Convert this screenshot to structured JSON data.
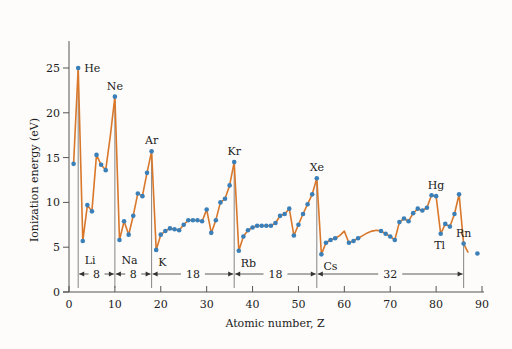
{
  "chart_data": {
    "type": "line",
    "title": "",
    "xlabel": "Atomic number, Z",
    "ylabel": "Ionization energy (eV)",
    "xlim": [
      0,
      90
    ],
    "ylim": [
      0,
      28
    ],
    "xticks": [
      0,
      10,
      20,
      30,
      40,
      50,
      60,
      70,
      80,
      90
    ],
    "yticks": [
      0,
      5,
      10,
      15,
      20,
      25
    ],
    "grid": false,
    "legend": null,
    "series": [
      {
        "name": "First ionization energy",
        "line_color": "#d9772a",
        "marker_color": "#3a7fb8",
        "points": [
          [
            1,
            14.3
          ],
          [
            2,
            25.0
          ],
          [
            3,
            5.7
          ],
          [
            4,
            9.7
          ],
          [
            5,
            9.0
          ],
          [
            6,
            15.3
          ],
          [
            7,
            14.2
          ],
          [
            8,
            13.6
          ],
          [
            9,
            17.4
          ],
          [
            10,
            21.8
          ],
          [
            11,
            5.8
          ],
          [
            12,
            7.9
          ],
          [
            13,
            6.4
          ],
          [
            14,
            8.5
          ],
          [
            15,
            11.0
          ],
          [
            16,
            10.7
          ],
          [
            17,
            13.3
          ],
          [
            18,
            15.7
          ],
          [
            19,
            4.7
          ],
          [
            20,
            6.4
          ],
          [
            21,
            6.8
          ],
          [
            22,
            7.1
          ],
          [
            23,
            7.0
          ],
          [
            24,
            6.9
          ],
          [
            25,
            7.5
          ],
          [
            26,
            8.0
          ],
          [
            27,
            8.0
          ],
          [
            28,
            8.0
          ],
          [
            29,
            7.9
          ],
          [
            30,
            9.2
          ],
          [
            31,
            6.6
          ],
          [
            32,
            8.0
          ],
          [
            33,
            10.0
          ],
          [
            34,
            10.4
          ],
          [
            35,
            11.9
          ],
          [
            36,
            14.5
          ],
          [
            37,
            4.6
          ],
          [
            38,
            6.2
          ],
          [
            39,
            6.9
          ],
          [
            40,
            7.2
          ],
          [
            41,
            7.4
          ],
          [
            42,
            7.4
          ],
          [
            43,
            7.4
          ],
          [
            44,
            7.4
          ],
          [
            45,
            7.7
          ],
          [
            46,
            8.5
          ],
          [
            47,
            8.7
          ],
          [
            48,
            9.3
          ],
          [
            49,
            6.3
          ],
          [
            50,
            7.5
          ],
          [
            51,
            8.7
          ],
          [
            52,
            9.8
          ],
          [
            53,
            10.9
          ],
          [
            54,
            12.7
          ],
          [
            55,
            4.2
          ],
          [
            56,
            5.5
          ],
          [
            57,
            5.8
          ],
          [
            58,
            6.0
          ],
          [
            59,
            6.3
          ],
          [
            60,
            6.8
          ],
          [
            61,
            5.5
          ],
          [
            62,
            5.7
          ],
          [
            63,
            6.0
          ],
          [
            64,
            6.3
          ],
          [
            65,
            6.6
          ],
          [
            66,
            6.8
          ],
          [
            67,
            6.9
          ],
          [
            68,
            6.8
          ],
          [
            69,
            6.5
          ],
          [
            70,
            6.2
          ],
          [
            71,
            5.8
          ],
          [
            72,
            7.8
          ],
          [
            73,
            8.2
          ],
          [
            74,
            7.9
          ],
          [
            75,
            8.8
          ],
          [
            76,
            9.3
          ],
          [
            77,
            9.1
          ],
          [
            78,
            9.4
          ],
          [
            79,
            10.8
          ],
          [
            80,
            10.7
          ],
          [
            81,
            6.5
          ],
          [
            82,
            7.6
          ],
          [
            83,
            7.3
          ],
          [
            84,
            8.7
          ],
          [
            85,
            10.9
          ],
          [
            86,
            5.4
          ],
          [
            87,
            4.4
          ]
        ],
        "markers_at": [
          1,
          2,
          3,
          4,
          5,
          6,
          7,
          8,
          10,
          11,
          12,
          13,
          14,
          15,
          16,
          17,
          18,
          19,
          20,
          21,
          22,
          23,
          24,
          25,
          26,
          27,
          28,
          29,
          30,
          31,
          32,
          33,
          34,
          35,
          36,
          37,
          38,
          39,
          40,
          41,
          42,
          43,
          44,
          45,
          46,
          47,
          48,
          49,
          50,
          51,
          52,
          53,
          54,
          55,
          56,
          57,
          58,
          61,
          62,
          63,
          68,
          69,
          70,
          71,
          72,
          73,
          74,
          75,
          76,
          77,
          78,
          79,
          80,
          81,
          82,
          83,
          84,
          85,
          86,
          89
        ]
      }
    ],
    "annotations": [
      {
        "text": "He",
        "z": 2,
        "pos": "right"
      },
      {
        "text": "Ne",
        "z": 10,
        "pos": "above"
      },
      {
        "text": "Ar",
        "z": 18,
        "pos": "above"
      },
      {
        "text": "Kr",
        "z": 36,
        "pos": "above"
      },
      {
        "text": "Xe",
        "z": 54,
        "pos": "above"
      },
      {
        "text": "Hg",
        "z": 80,
        "pos": "above"
      },
      {
        "text": "Rn",
        "z": 86,
        "pos": "above"
      },
      {
        "text": "Li",
        "z": 3,
        "pos": "below"
      },
      {
        "text": "Na",
        "z": 11,
        "pos": "below"
      },
      {
        "text": "K",
        "z": 19,
        "pos": "below"
      },
      {
        "text": "Rb",
        "z": 37,
        "pos": "below"
      },
      {
        "text": "Cs",
        "z": 55,
        "pos": "below"
      },
      {
        "text": "Tl",
        "z": 81,
        "pos": "below"
      }
    ],
    "period_spans": [
      {
        "from": 2,
        "to": 10,
        "label": "8"
      },
      {
        "from": 10,
        "to": 18,
        "label": "8"
      },
      {
        "from": 18,
        "to": 36,
        "label": "18"
      },
      {
        "from": 36,
        "to": 54,
        "label": "18"
      },
      {
        "from": 54,
        "to": 86,
        "label": "32"
      }
    ],
    "divider_lines_at": [
      2,
      10,
      18,
      36,
      54,
      86
    ]
  }
}
